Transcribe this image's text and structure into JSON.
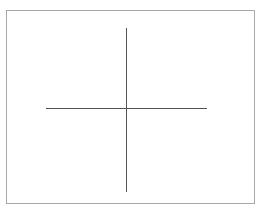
{
  "diagram": {
    "type": "crosshair",
    "frame": {
      "x": 6,
      "y": 10,
      "width": 249,
      "height": 194,
      "border_color": "#a8a8a8",
      "background": "#ffffff"
    },
    "horizontal_line": {
      "x1": 46,
      "x2": 207,
      "y": 108,
      "color": "#555555"
    },
    "vertical_line": {
      "x": 126,
      "y1": 28,
      "y2": 192,
      "color": "#555555"
    },
    "text": []
  }
}
